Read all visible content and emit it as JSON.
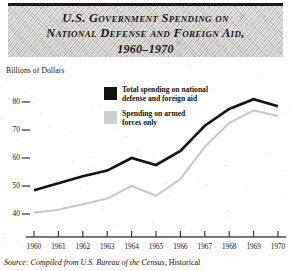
{
  "title": {
    "line1": "U.S. Government Spending on",
    "line2": "National Defense and Foreign Aid,",
    "line3": "1960–1970"
  },
  "axis_caption": "Billions of Dollars",
  "legend": {
    "items": [
      {
        "swatch": "black",
        "color": "#121212",
        "line1": "Total spending on national",
        "line2": "defense and foreign aid"
      },
      {
        "swatch": "gray",
        "color": "#cfcfcf",
        "line1": "Spending on armed",
        "line2": "forces only"
      }
    ]
  },
  "source": {
    "prefix": "Source: Compiled from U.S. Bureau of the Census,",
    "suffix": "Historical"
  },
  "chart_data": {
    "type": "line",
    "title": "U.S. Government Spending on National Defense and Foreign Aid, 1960–1970",
    "xlabel": "",
    "ylabel": "Billions of Dollars",
    "ylim": [
      35,
      85
    ],
    "xlim": [
      1960,
      1970
    ],
    "yticks": [
      40,
      50,
      60,
      70,
      80
    ],
    "ytick_labels": [
      "40",
      "50",
      "60",
      "70",
      "80"
    ],
    "grid": false,
    "legend_position": "inside-upper-center",
    "categories": [
      1960,
      1961,
      1962,
      1963,
      1964,
      1965,
      1966,
      1967,
      1968,
      1969,
      1970
    ],
    "xtick_labels": [
      "1960",
      "1961",
      "1962",
      "1963",
      "1964",
      "1965",
      "1966",
      "1967",
      "1968",
      "1969",
      "1970"
    ],
    "series": [
      {
        "name": "Total spending on national defense and foreign aid",
        "color": "#121212",
        "values": [
          48.5,
          51.0,
          53.5,
          55.5,
          60.0,
          57.5,
          62.5,
          71.5,
          77.5,
          81.0,
          78.5
        ]
      },
      {
        "name": "Spending on armed forces only",
        "color": "#c9c9c9",
        "values": [
          40.5,
          41.5,
          43.5,
          45.5,
          50.0,
          46.5,
          52.5,
          64.0,
          72.5,
          77.0,
          75.0
        ]
      }
    ]
  }
}
